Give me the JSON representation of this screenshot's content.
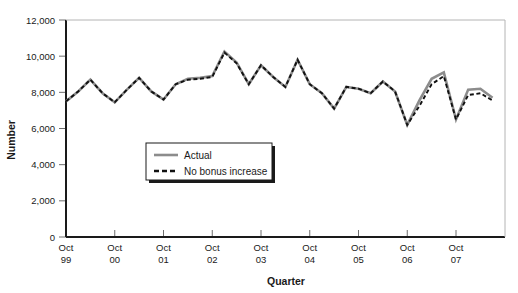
{
  "chart_data": {
    "type": "line",
    "title": "",
    "xlabel": "Quarter",
    "ylabel": "Number",
    "ylim": [
      0,
      12000
    ],
    "ytick_values": [
      0,
      2000,
      4000,
      6000,
      8000,
      10000,
      12000
    ],
    "ytick_labels": [
      "0",
      "2,000",
      "4,000",
      "6,000",
      "8,000",
      "10,000",
      "12,000"
    ],
    "grid": false,
    "legend_position": "center-left-inside",
    "xtick_labels": [
      {
        "line1": "Oct",
        "line2": "99"
      },
      {
        "line1": "Oct",
        "line2": "00"
      },
      {
        "line1": "Oct",
        "line2": "01"
      },
      {
        "line1": "Oct",
        "line2": "02"
      },
      {
        "line1": "Oct",
        "line2": "03"
      },
      {
        "line1": "Oct",
        "line2": "04"
      },
      {
        "line1": "Oct",
        "line2": "05"
      },
      {
        "line1": "Oct",
        "line2": "06"
      },
      {
        "line1": "Oct",
        "line2": "07"
      }
    ],
    "x": [
      "Oct 99",
      "Jan 00",
      "Apr 00",
      "Jul 00",
      "Oct 00",
      "Jan 01",
      "Apr 01",
      "Jul 01",
      "Oct 01",
      "Jan 02",
      "Apr 02",
      "Jul 02",
      "Oct 02",
      "Jan 03",
      "Apr 03",
      "Jul 03",
      "Oct 03",
      "Jan 04",
      "Apr 04",
      "Jul 04",
      "Oct 04",
      "Jan 05",
      "Apr 05",
      "Jul 05",
      "Oct 05",
      "Jan 06",
      "Apr 06",
      "Jul 06",
      "Oct 06",
      "Jan 07",
      "Apr 07",
      "Jul 07",
      "Oct 07",
      "Jan 08",
      "Apr 08",
      "Jul 08"
    ],
    "series": [
      {
        "name": "Actual",
        "style": "solid",
        "color": "#8c8c8c",
        "values": [
          7500,
          8050,
          8700,
          7950,
          7450,
          8150,
          8800,
          8050,
          7600,
          8450,
          8750,
          8800,
          8900,
          10250,
          9650,
          8450,
          9500,
          8850,
          8300,
          9800,
          8450,
          7950,
          7100,
          8300,
          8200,
          7950,
          8600,
          8050,
          6200,
          7550,
          8750,
          9100,
          6500,
          8150,
          8200,
          7700
        ]
      },
      {
        "name": "No bonus increase",
        "style": "dashed",
        "color": "#111111",
        "values": [
          7500,
          8050,
          8700,
          7950,
          7450,
          8150,
          8800,
          8050,
          7600,
          8450,
          8700,
          8750,
          8850,
          10200,
          9600,
          8450,
          9500,
          8850,
          8300,
          9800,
          8450,
          7950,
          7100,
          8300,
          8200,
          7950,
          8600,
          8050,
          6200,
          7250,
          8450,
          8900,
          6500,
          7850,
          7950,
          7550
        ]
      }
    ]
  },
  "legend": {
    "items": [
      {
        "label": "Actual",
        "style": "solid"
      },
      {
        "label": "No bonus increase",
        "style": "dashed"
      }
    ]
  }
}
